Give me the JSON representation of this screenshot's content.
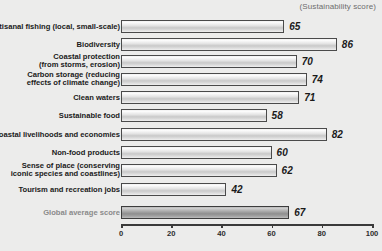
{
  "header": {
    "axis_note": "(Sustainability score)"
  },
  "chart_data": {
    "type": "bar",
    "orientation": "horizontal",
    "title": "",
    "subtitle": "",
    "xlabel": "",
    "ylabel": "",
    "annotation": "(Sustainability score)",
    "xlim": [
      0,
      100
    ],
    "xticks": [
      0,
      20,
      40,
      60,
      80,
      100
    ],
    "xtick_labels": [
      "0",
      "20",
      "40",
      "60",
      "80",
      "100"
    ],
    "grid": false,
    "legend": null,
    "categories": [
      "Artisanal fishing (local, small-scale)",
      "Biodiversity",
      "Coastal protection\n(from storms, erosion)",
      "Carbon storage (reducing\neffects of climate change)",
      "Clean waters",
      "Sustainable food",
      "Coastal livelihoods and economies",
      "Non-food products",
      "Sense of place (conserving\niconic species and coastlines)",
      "Tourism and recreation jobs",
      "Global average score"
    ],
    "values": [
      65,
      86,
      70,
      74,
      71,
      58,
      82,
      60,
      62,
      42,
      67
    ],
    "value_labels": [
      "65",
      "86",
      "70",
      "74",
      "71",
      "58",
      "82",
      "60",
      "62",
      "42",
      "67"
    ],
    "highlight_index": 10,
    "colors": {
      "background": "#ececeb",
      "bar_fill_light": "#e4e4e4",
      "bar_fill_highlight": "#a0a0a0",
      "bar_border": "#4a4a4a",
      "label_text": "#1a1a1a",
      "muted_label_text": "#8a8a8a",
      "axis": "#3a3a3a",
      "note_text": "#6d6d6d"
    }
  }
}
